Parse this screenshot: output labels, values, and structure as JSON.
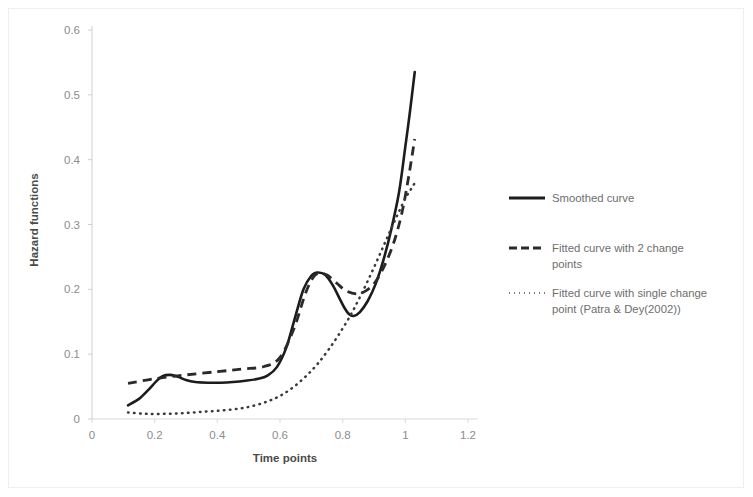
{
  "chart_data": {
    "type": "line",
    "title": "",
    "xlabel": "Time points",
    "ylabel": "Hazard functions",
    "xlim": [
      0,
      1.2
    ],
    "ylim": [
      0,
      0.6
    ],
    "xticks": [
      "0",
      "0.2",
      "0.4",
      "0.6",
      "0.8",
      "1",
      "1.2"
    ],
    "xtick_values": [
      0,
      0.2,
      0.4,
      0.6,
      0.8,
      1,
      1.2
    ],
    "yticks": [
      "0",
      "0.1",
      "0.2",
      "0.3",
      "0.4",
      "0.5",
      "0.6"
    ],
    "ytick_values": [
      0,
      0.1,
      0.2,
      0.3,
      0.4,
      0.5,
      0.6
    ],
    "grid": false,
    "legend_position": "right",
    "series": [
      {
        "name": "Smoothed curve",
        "style": "solid",
        "color": "#1c1c1c",
        "x": [
          0.115,
          0.15,
          0.18,
          0.205,
          0.225,
          0.25,
          0.275,
          0.3,
          0.33,
          0.37,
          0.41,
          0.45,
          0.49,
          0.53,
          0.56,
          0.59,
          0.62,
          0.65,
          0.675,
          0.7,
          0.72,
          0.745,
          0.77,
          0.79,
          0.805,
          0.82,
          0.835,
          0.855,
          0.88,
          0.905,
          0.93,
          0.955,
          0.98,
          1.0,
          1.015,
          1.03
        ],
        "y": [
          0.021,
          0.031,
          0.045,
          0.058,
          0.066,
          0.068,
          0.065,
          0.06,
          0.057,
          0.056,
          0.056,
          0.057,
          0.059,
          0.062,
          0.067,
          0.08,
          0.11,
          0.16,
          0.2,
          0.221,
          0.226,
          0.222,
          0.205,
          0.186,
          0.172,
          0.162,
          0.159,
          0.165,
          0.182,
          0.208,
          0.245,
          0.292,
          0.35,
          0.42,
          0.475,
          0.535
        ]
      },
      {
        "name": "Fitted curve with 2 change points",
        "style": "dashed",
        "color": "#2a2a2a",
        "x": [
          0.115,
          0.2,
          0.3,
          0.4,
          0.48,
          0.55,
          0.6,
          0.645,
          0.68,
          0.705,
          0.725,
          0.75,
          0.78,
          0.81,
          0.845,
          0.875,
          0.905,
          0.935,
          0.965,
          0.99,
          1.01,
          1.03
        ],
        "y": [
          0.055,
          0.062,
          0.068,
          0.073,
          0.077,
          0.081,
          0.095,
          0.14,
          0.192,
          0.218,
          0.225,
          0.222,
          0.21,
          0.198,
          0.193,
          0.198,
          0.212,
          0.238,
          0.275,
          0.32,
          0.372,
          0.432
        ]
      },
      {
        "name": "Fitted curve with single change point (Patra & Dey(2002))",
        "style": "dotted",
        "color": "#3a3a3a",
        "x": [
          0.115,
          0.17,
          0.23,
          0.29,
          0.35,
          0.41,
          0.47,
          0.52,
          0.565,
          0.605,
          0.645,
          0.685,
          0.72,
          0.755,
          0.79,
          0.825,
          0.855,
          0.885,
          0.915,
          0.945,
          0.975,
          1.0,
          1.02,
          1.035
        ],
        "y": [
          0.01,
          0.008,
          0.008,
          0.009,
          0.011,
          0.013,
          0.016,
          0.021,
          0.028,
          0.037,
          0.05,
          0.067,
          0.085,
          0.107,
          0.132,
          0.16,
          0.188,
          0.218,
          0.25,
          0.283,
          0.315,
          0.34,
          0.356,
          0.368
        ]
      }
    ],
    "legend_entries": [
      "Smoothed curve",
      "Fitted curve with 2 change points",
      "Fitted curve with single change point (Patra & Dey(2002))"
    ],
    "legend_entry_lines": [
      [
        "Smoothed curve"
      ],
      [
        "Fitted curve with 2 change",
        "points"
      ],
      [
        "Fitted curve with single change",
        "point (Patra & Dey(2002))"
      ]
    ]
  },
  "axes": {
    "x_title": "Time points",
    "y_title": "Hazard functions"
  },
  "colors": {
    "solid": "#1c1c1c",
    "dashed": "#2a2a2a",
    "dotted": "#3a3a3a",
    "axis": "#d9d9d9",
    "tick_text": "#8c8c8c",
    "title_text": "#4a4a4a",
    "legend_text": "#6e6e6e",
    "background": "#ffffff"
  }
}
